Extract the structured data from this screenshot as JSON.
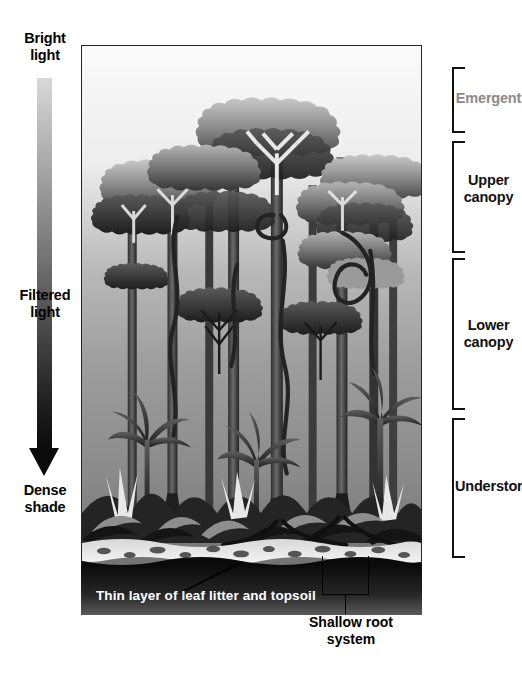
{
  "diagram": {
    "light_axis": {
      "top_label": "Bright\nlight",
      "middle_label": "Filtered\nlight",
      "bottom_label": "Dense\nshade",
      "gradient_from": "#d9d9d9",
      "gradient_to": "#0b0b0b"
    },
    "layers": [
      {
        "label": "Emergent",
        "color": "#8a8a8a",
        "top": 67,
        "height": 66
      },
      {
        "label": "Upper\ncanopy",
        "color": "#111111",
        "top": 141,
        "height": 112
      },
      {
        "label": "Lower\ncanopy",
        "color": "#111111",
        "top": 258,
        "height": 152
      },
      {
        "label": "Understory",
        "color": "#111111",
        "top": 418,
        "height": 140
      }
    ],
    "captions": {
      "soil": "Thin layer of leaf litter and topsoil",
      "roots": "Shallow root\nsystem"
    },
    "scene": {
      "sky_light": "#f2f2f2",
      "sky_mid": "#9b9b9b",
      "forest_dark": "#2b2b2b",
      "soil_dark": "#141414",
      "litter_light": "#efefef"
    }
  }
}
